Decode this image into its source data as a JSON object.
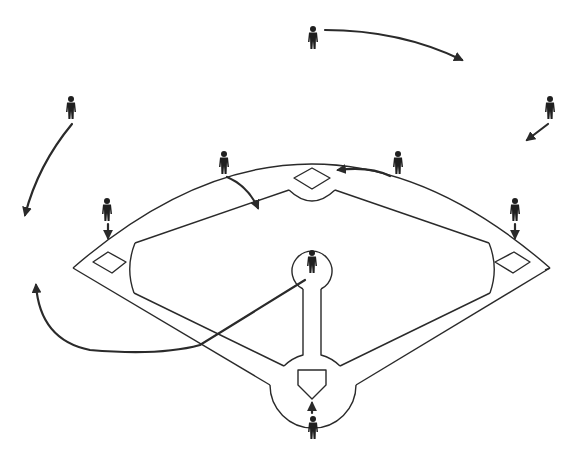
{
  "title": "",
  "diagram": {
    "type": "baseball-defensive-positioning",
    "colors": {
      "lines": "#2a2a2a",
      "players": "#1f1f1f",
      "background": "#ffffff"
    },
    "bases": [
      {
        "name": "first-base",
        "x": 512,
        "y": 262
      },
      {
        "name": "second-base",
        "x": 312,
        "y": 178
      },
      {
        "name": "third-base",
        "x": 110,
        "y": 262
      },
      {
        "name": "home-plate",
        "x": 312,
        "y": 385
      }
    ],
    "players": [
      {
        "name": "center-fielder",
        "x": 313,
        "y": 38,
        "movement": "curved arrow to the right"
      },
      {
        "name": "left-fielder",
        "x": 71,
        "y": 108,
        "movement": "curved arrow down-left"
      },
      {
        "name": "right-fielder",
        "x": 550,
        "y": 108,
        "movement": "short arrow down-left"
      },
      {
        "name": "shortstop",
        "x": 224,
        "y": 163,
        "movement": "curved arrow toward infield"
      },
      {
        "name": "second-baseman",
        "x": 398,
        "y": 163,
        "movement": "arrow toward second base"
      },
      {
        "name": "third-baseman",
        "x": 107,
        "y": 210,
        "movement": "arrow down to third base"
      },
      {
        "name": "first-baseman",
        "x": 515,
        "y": 210,
        "movement": "arrow down to first base"
      },
      {
        "name": "pitcher",
        "x": 312,
        "y": 262,
        "movement": "long curved arrow toward third-base foul area"
      },
      {
        "name": "catcher",
        "x": 313,
        "y": 428,
        "movement": "arrow up to home plate"
      }
    ]
  }
}
